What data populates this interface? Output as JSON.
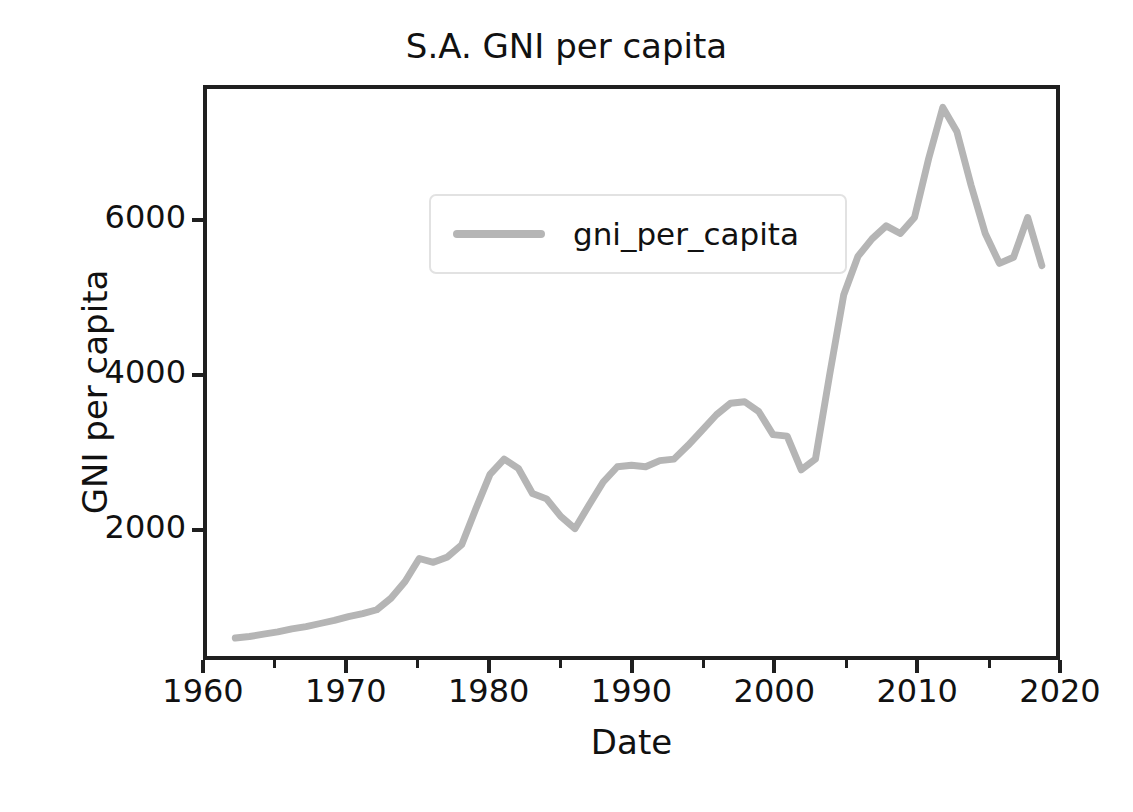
{
  "chart_data": {
    "type": "line",
    "title": "S.A. GNI per capita",
    "xlabel": "Date",
    "ylabel": "GNI per capita",
    "grid": false,
    "legend_position": "upper left",
    "line_color": "#b5b5b5",
    "line_width": 7,
    "xlim": [
      1960,
      2020
    ],
    "ylim": [
      325,
      7740
    ],
    "xticks": [
      1960,
      1970,
      1980,
      1990,
      2000,
      2010,
      2020
    ],
    "xtick_labels": [
      "1960",
      "1970",
      "1980",
      "1990",
      "2000",
      "2010",
      "2020"
    ],
    "xminor_ticks": [
      1965,
      1975,
      1985,
      1995,
      2005,
      2015
    ],
    "yticks": [
      2000,
      4000,
      6000
    ],
    "ytick_labels": [
      "2000",
      "4000",
      "6000"
    ],
    "series": [
      {
        "name": "gni_per_capita",
        "x": [
          1962,
          1963,
          1964,
          1965,
          1966,
          1967,
          1968,
          1969,
          1970,
          1971,
          1972,
          1973,
          1974,
          1975,
          1976,
          1977,
          1978,
          1979,
          1980,
          1981,
          1982,
          1983,
          1984,
          1985,
          1986,
          1987,
          1988,
          1989,
          1990,
          1991,
          1992,
          1993,
          1994,
          1995,
          1996,
          1997,
          1998,
          1999,
          2000,
          2001,
          2002,
          2003,
          2004,
          2005,
          2006,
          2007,
          2008,
          2009,
          2010,
          2011,
          2012,
          2013,
          2014,
          2015,
          2016,
          2017,
          2018,
          2019
        ],
        "values": [
          560,
          580,
          610,
          640,
          680,
          710,
          750,
          790,
          840,
          880,
          930,
          1080,
          1300,
          1600,
          1550,
          1620,
          1780,
          2250,
          2700,
          2900,
          2780,
          2450,
          2380,
          2150,
          1990,
          2300,
          2600,
          2800,
          2820,
          2800,
          2880,
          2900,
          3080,
          3280,
          3480,
          3630,
          3650,
          3520,
          3220,
          3200,
          2760,
          2900,
          4000,
          5050,
          5550,
          5780,
          5950,
          5850,
          6060,
          6830,
          7500,
          7180,
          6480,
          5850,
          5460,
          5540,
          6060,
          5430
        ]
      }
    ]
  },
  "legend": {
    "label": "gni_per_capita"
  }
}
